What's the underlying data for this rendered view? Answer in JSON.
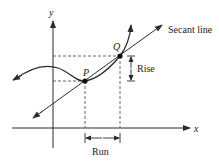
{
  "diagram": {
    "axes": {
      "x_label": "x",
      "y_label": "y"
    },
    "points": [
      {
        "id": "P",
        "label": "P",
        "px": 85,
        "py": 81
      },
      {
        "id": "Q",
        "label": "Q",
        "px": 120,
        "py": 56
      }
    ],
    "labels": {
      "secant": "Secant line",
      "rise": "Rise",
      "run": "Run"
    },
    "colors": {
      "line": "#2b2b2b",
      "dash": "#555555",
      "background": "#ffffff"
    }
  }
}
